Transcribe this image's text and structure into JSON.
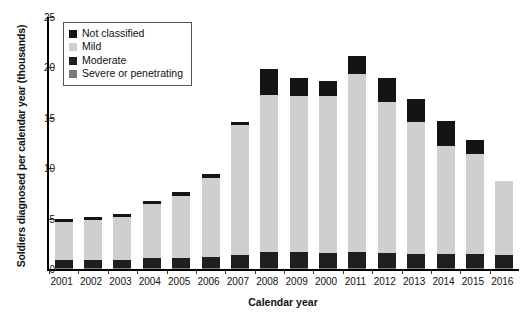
{
  "chart_data": {
    "type": "bar",
    "subtype": "stacked-bar",
    "title": "",
    "xlabel": "Calendar year",
    "ylabel": "Soldiers diagnosed per calendar year (thousands)",
    "categories": [
      "2001",
      "2002",
      "2003",
      "2004",
      "2005",
      "2006",
      "2007",
      "2008",
      "2009",
      "2000",
      "2011",
      "2012",
      "2013",
      "2014",
      "2015",
      "2016"
    ],
    "ylim": [
      0,
      25
    ],
    "yticks": [
      0,
      5,
      10,
      15,
      20,
      25
    ],
    "ytick_labels": [
      "0",
      "5",
      "10",
      "15",
      "20",
      "25"
    ],
    "grid": false,
    "legend_position": "upper-left-inside",
    "stack_order_bottom_to_top": [
      "Severe or penetrating",
      "Moderate",
      "Mild",
      "Not classified"
    ],
    "series": [
      {
        "name": "Severe or penetrating",
        "color": "#7a7a7a",
        "values": [
          0.1,
          0.1,
          0.1,
          0.12,
          0.12,
          0.12,
          0.14,
          0.14,
          0.14,
          0.14,
          0.14,
          0.12,
          0.12,
          0.1,
          0.1,
          0.1
        ]
      },
      {
        "name": "Moderate",
        "color": "#1f1f1f",
        "values": [
          0.75,
          0.75,
          0.8,
          0.95,
          1.0,
          1.05,
          1.3,
          1.55,
          1.5,
          1.45,
          1.55,
          1.45,
          1.35,
          1.35,
          1.35,
          1.3
        ]
      },
      {
        "name": "Mild",
        "color": "#cfcfcf",
        "values": [
          3.85,
          4.05,
          4.3,
          5.4,
          6.15,
          7.85,
          12.85,
          15.6,
          15.55,
          15.6,
          17.7,
          15.0,
          13.15,
          10.75,
          9.95,
          7.3
        ]
      },
      {
        "name": "Not classified",
        "color": "#141414",
        "values": [
          0.3,
          0.3,
          0.3,
          0.33,
          0.33,
          0.38,
          0.31,
          2.51,
          1.81,
          1.51,
          1.71,
          2.43,
          2.28,
          2.5,
          1.4,
          0.0
        ]
      }
    ],
    "totals": [
      5.0,
      5.2,
      5.5,
      6.8,
      7.6,
      9.4,
      14.6,
      19.8,
      19.0,
      18.7,
      21.1,
      19.0,
      16.9,
      14.7,
      12.8,
      8.7
    ],
    "totals_note": "Bar totals in thousands of soldiers"
  },
  "legend": {
    "items": [
      {
        "label": "Not classified",
        "color": "#141414"
      },
      {
        "label": "Mild",
        "color": "#cfcfcf"
      },
      {
        "label": "Moderate",
        "color": "#1f1f1f"
      },
      {
        "label": "Severe or penetrating",
        "color": "#7a7a7a"
      }
    ]
  }
}
